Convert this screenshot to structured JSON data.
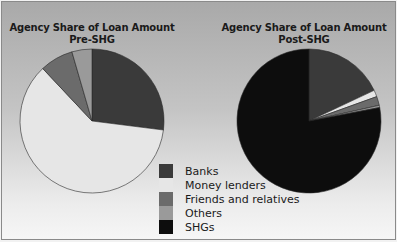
{
  "chart_data": [
    {
      "type": "pie",
      "title": "Agency Share of Loan Amount",
      "subtitle": "Pre-SHG",
      "categories": [
        "Banks",
        "Money lenders",
        "Friends and relatives",
        "Others",
        "SHGs"
      ],
      "values": [
        27,
        61,
        7.5,
        4.5,
        0
      ],
      "unit": "%"
    },
    {
      "type": "pie",
      "title": "Agency Share of Loan Amount",
      "subtitle": "Post-SHG",
      "categories": [
        "Banks",
        "Money lenders",
        "Friends and relatives",
        "Others",
        "SHGs"
      ],
      "values": [
        18,
        1.5,
        2,
        0.5,
        78
      ],
      "unit": "%"
    }
  ],
  "legend": {
    "position": "bottom-center",
    "items": [
      {
        "label": "Banks",
        "color": "#3a3a3a"
      },
      {
        "label": "Money lenders",
        "color": "#e6e6e6"
      },
      {
        "label": "Friends and relatives",
        "color": "#6b6b6b"
      },
      {
        "label": "Others",
        "color": "#9a9a9a"
      },
      {
        "label": "SHGs",
        "color": "#0d0d0d"
      }
    ]
  },
  "charts": {
    "pre": {
      "title_line1": "Agency Share of Loan Amount",
      "title_line2": "Pre-SHG"
    },
    "post": {
      "title_line1": "Agency Share of Loan Amount",
      "title_line2": "Post-SHG"
    }
  }
}
